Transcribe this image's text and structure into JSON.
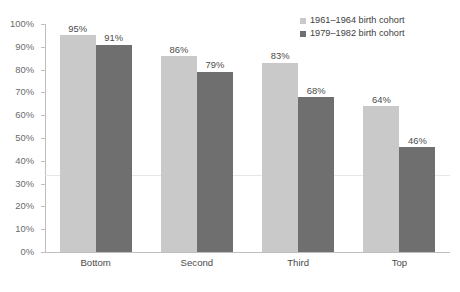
{
  "chart_data": {
    "type": "bar",
    "title": "",
    "xlabel": "",
    "ylabel": "",
    "ylim": [
      0,
      100
    ],
    "ytick_labels": [
      "0%",
      "10%",
      "20%",
      "30%",
      "40%",
      "50%",
      "60%",
      "70%",
      "80%",
      "90%",
      "100%"
    ],
    "ytick_values": [
      0,
      10,
      20,
      30,
      40,
      50,
      60,
      70,
      80,
      90,
      100
    ],
    "grid": false,
    "legend_position": "top-right",
    "value_suffix": "%",
    "categories": [
      "Bottom",
      "Second",
      "Third",
      "Top"
    ],
    "series": [
      {
        "name": "1961–1964 birth cohort",
        "color": "#c9c9c9",
        "values": [
          95,
          91,
          86,
          83
        ],
        "values_ordered": [
          95,
          86,
          83,
          64
        ],
        "labels": [
          "95%",
          "86%",
          "83%",
          "64%"
        ]
      },
      {
        "name": "1979–1982 birth cohort",
        "color": "#6f6f6f",
        "values_ordered": [
          91,
          79,
          68,
          46
        ],
        "labels": [
          "91%",
          "79%",
          "68%",
          "46%"
        ]
      }
    ]
  },
  "legend": {
    "entries": [
      {
        "label": "1961–1964 birth cohort",
        "color": "#c9c9c9"
      },
      {
        "label": "1979–1982 birth cohort",
        "color": "#6f6f6f"
      }
    ]
  },
  "axis": {
    "line_color": "#bfbfbf",
    "tick_color": "#bfbfbf",
    "label_color": "#6b6b6b"
  }
}
